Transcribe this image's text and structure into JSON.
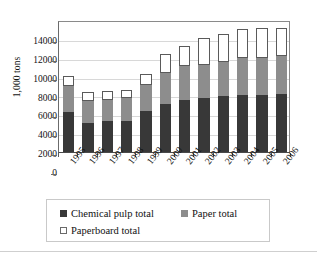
{
  "chart_data": {
    "type": "bar",
    "subtype": "stacked-vertical",
    "title": "",
    "xlabel": "",
    "ylabel": "1,000 tons",
    "ylim": [
      0,
      14000
    ],
    "ytick_step": 2000,
    "yticks": [
      "14000",
      "12000",
      "10000",
      "8000",
      "6000",
      "4000",
      "2000",
      "0"
    ],
    "ytick_values": [
      14000,
      12000,
      10000,
      8000,
      6000,
      4000,
      2000,
      0
    ],
    "grid": true,
    "grid_axis": "y",
    "legend_position": "bottom",
    "categories": [
      "1995",
      "1996",
      "1997",
      "1998",
      "1999",
      "2000",
      "2001",
      "2002",
      "2003",
      "2004",
      "2005",
      "2006"
    ],
    "series": [
      {
        "name": "Chemical pulp total",
        "color": "#383838",
        "values": [
          4200,
          3100,
          3250,
          3300,
          4400,
          5100,
          5500,
          5750,
          5900,
          6000,
          6050,
          6200
        ]
      },
      {
        "name": "Paper total",
        "color": "#8d8d8d",
        "values": [
          2800,
          2350,
          2300,
          2400,
          2700,
          3300,
          3650,
          3450,
          3650,
          4000,
          3950,
          4000
        ]
      },
      {
        "name": "Paperboard total",
        "color": "#ffffff",
        "values": [
          1100,
          900,
          900,
          900,
          1200,
          1950,
          2100,
          2900,
          2950,
          3100,
          3200,
          3000
        ]
      }
    ],
    "totals": [
      8100,
      6350,
      6450,
      6600,
      8300,
      10350,
      11250,
      12100,
      12500,
      13100,
      13200,
      13200
    ]
  },
  "axis": {
    "y_title": "1,000 tons"
  },
  "legend": {
    "items": [
      {
        "label": "Chemical pulp total",
        "swatch": "dark-square-swatch"
      },
      {
        "label": "Paper total",
        "swatch": "gray-square-swatch"
      },
      {
        "label": "Paperboard total",
        "swatch": "white-square-swatch"
      }
    ]
  }
}
